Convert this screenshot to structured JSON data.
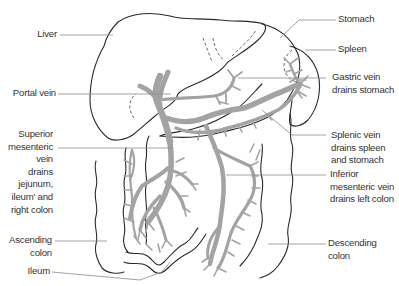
{
  "figure": {
    "colors": {
      "outline": "#2a2a2a",
      "vein": "#a3a3a3",
      "leader_line": "#8a8a8a",
      "label_text": "#333333",
      "background": "#ffffff"
    }
  },
  "labels": {
    "left": [
      {
        "id": "liver",
        "text": "Liver"
      },
      {
        "id": "portal_vein",
        "text": "Portal vein"
      },
      {
        "id": "superior_mesenteric_vein",
        "text": "Superior\nmesenteric\nvein\ndrains\njejunum,\nileum' and\nright colon"
      },
      {
        "id": "ascending_colon",
        "text": "Ascending\ncolon"
      },
      {
        "id": "ileum",
        "text": "Ileum"
      }
    ],
    "right": [
      {
        "id": "stomach",
        "text": "Stomach"
      },
      {
        "id": "spleen",
        "text": "Spleen"
      },
      {
        "id": "gastric_vein",
        "text": "Gastric vein\ndrains stomach"
      },
      {
        "id": "splenic_vein",
        "text": "Splenic vein\ndrains spleen\nand stomach"
      },
      {
        "id": "inferior_mesenteric_vein",
        "text": "Inferior\nmesenteric vein\ndrains left colon"
      },
      {
        "id": "descending_colon",
        "text": "Descending colon"
      }
    ]
  }
}
